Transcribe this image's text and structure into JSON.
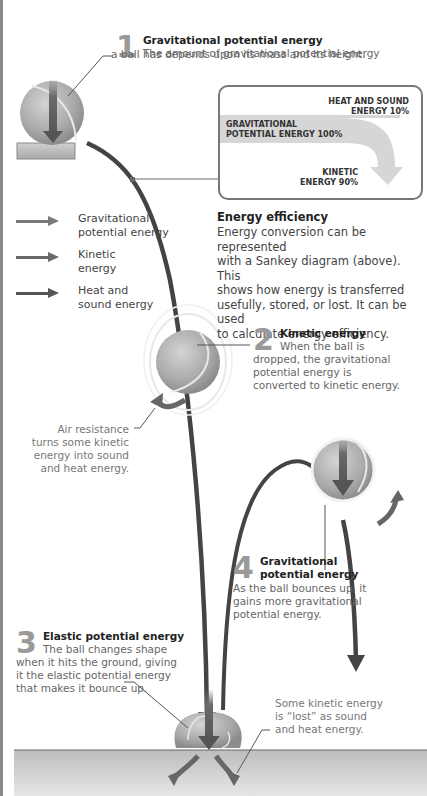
{
  "colors": {
    "gravitational_arrow": "#7a7a7a",
    "kinetic_arrow": "#6a6a6a",
    "heat_sound_arrow": "#555555",
    "trajectory": "#444444",
    "ball": "#b0b0b0",
    "ground": "#c8c8c8",
    "sankey_flow": "#d6d6d6",
    "box_border": "#777777",
    "number_gray": "#9a9a9a"
  },
  "steps": [
    {
      "number": "1",
      "title": "Gravitational potential energy",
      "text_line1": "The amount of gravitational potential energy",
      "text_line2": "a ball has depends upon its mass and its height."
    },
    {
      "number": "2",
      "title": "Kinetic energy",
      "text_line1": "When the ball is",
      "text_line2": "dropped, the gravitational",
      "text_line3": "potential energy is",
      "text_line4": "converted to kinetic energy."
    },
    {
      "number": "3",
      "title": "Elastic potential energy",
      "text_line1": "The ball changes shape",
      "text_line2": "when it hits the ground, giving",
      "text_line3": "it the elastic potential energy",
      "text_line4": "that makes it bounce up."
    },
    {
      "number": "4",
      "title_line1": "Gravitational",
      "title_line2": "potential energy",
      "text_line1": "As the ball bounces up, it",
      "text_line2": "gains more gravitational",
      "text_line3": "potential energy."
    }
  ],
  "legend": [
    {
      "label_line1": "Gravitational",
      "label_line2": "potential energy",
      "icon": "arrow-right-icon"
    },
    {
      "label_line1": "Kinetic",
      "label_line2": "energy",
      "icon": "arrow-right-icon"
    },
    {
      "label_line1": "Heat and",
      "label_line2": "sound energy",
      "icon": "arrow-right-icon"
    }
  ],
  "sankey": {
    "input_line1": "GRAVITATIONAL",
    "input_line2": "POTENTIAL ENERGY 100%",
    "loss_line1": "HEAT AND SOUND",
    "loss_line2": "ENERGY 10%",
    "output_line1": "KINETIC",
    "output_line2": "ENERGY 90%"
  },
  "efficiency": {
    "title": "Energy efficiency",
    "line1": "Energy conversion can be represented",
    "line2": "with a Sankey diagram (above). This",
    "line3": "shows how energy is transferred",
    "line4": "usefully, stored, or lost. It can be used",
    "line5": "to calculate energy efficiency."
  },
  "notes": {
    "air_resistance": {
      "line1": "Air resistance",
      "line2": "turns some kinetic",
      "line3": "energy into sound",
      "line4": "and heat energy."
    },
    "lost_energy": {
      "line1": "Some kinetic energy",
      "line2": "is “lost” as sound",
      "line3": "and heat energy."
    }
  }
}
